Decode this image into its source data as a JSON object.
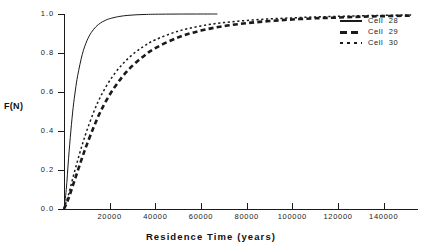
{
  "chart_data": {
    "type": "line",
    "title": "",
    "xlabel": "Residence Time  (years)",
    "ylabel": "F(N)",
    "xlim": [
      0,
      155000
    ],
    "ylim": [
      0.0,
      1.0
    ],
    "grid": false,
    "legend_position": "top-right",
    "xticks": [
      20000,
      40000,
      60000,
      80000,
      100000,
      120000,
      140000
    ],
    "xtick_labels": [
      "20000",
      "40000",
      "60000",
      "80000",
      "100000",
      "120000",
      "140000"
    ],
    "yticks": [
      0.0,
      0.2,
      0.4,
      0.6,
      0.8,
      1.0
    ],
    "ytick_labels": [
      "0.0",
      "0.2",
      "0.4",
      "0.6",
      "0.8",
      "1.0"
    ],
    "series": [
      {
        "name": "Cell  28",
        "style": "solid",
        "x": [
          0,
          1000,
          2000,
          3000,
          4000,
          5000,
          6000,
          8000,
          10000,
          12000,
          14000,
          16000,
          18000,
          20000,
          24000,
          28000,
          32000,
          36000,
          40000,
          46000,
          52000,
          58000,
          64000,
          67000
        ],
        "y": [
          0.0,
          0.1,
          0.26,
          0.4,
          0.52,
          0.61,
          0.685,
          0.793,
          0.862,
          0.906,
          0.935,
          0.954,
          0.967,
          0.976,
          0.987,
          0.993,
          0.9962,
          0.9978,
          0.9988,
          0.9995,
          0.9998,
          0.9999,
          1.0,
          1.0
        ]
      },
      {
        "name": "Cell  29",
        "style": "dashed-thick",
        "x": [
          0,
          2000,
          4000,
          6000,
          8000,
          10000,
          13000,
          16000,
          20000,
          25000,
          30000,
          35000,
          40000,
          50000,
          60000,
          70000,
          80000,
          90000,
          100000,
          110000,
          120000,
          130000,
          140000,
          152000
        ],
        "y": [
          0.0,
          0.055,
          0.125,
          0.195,
          0.265,
          0.33,
          0.42,
          0.5,
          0.586,
          0.67,
          0.735,
          0.785,
          0.825,
          0.88,
          0.915,
          0.938,
          0.953,
          0.964,
          0.972,
          0.978,
          0.982,
          0.986,
          0.989,
          0.992
        ]
      },
      {
        "name": "Cell  30",
        "style": "dotted-thin",
        "x": [
          0,
          2000,
          4000,
          6000,
          8000,
          10000,
          13000,
          16000,
          20000,
          25000,
          30000,
          35000,
          40000,
          50000,
          60000,
          70000,
          80000,
          90000,
          100000,
          110000,
          120000,
          130000,
          140000,
          152000
        ],
        "y": [
          0.0,
          0.075,
          0.165,
          0.25,
          0.33,
          0.402,
          0.497,
          0.576,
          0.658,
          0.735,
          0.792,
          0.835,
          0.868,
          0.912,
          0.939,
          0.956,
          0.967,
          0.975,
          0.98,
          0.985,
          0.988,
          0.991,
          0.993,
          0.995
        ]
      }
    ]
  },
  "legend": {
    "entries": [
      {
        "label": "Cell  28"
      },
      {
        "label": "Cell  29"
      },
      {
        "label": "Cell  30"
      }
    ]
  },
  "axes": {
    "y_title": "F(N)",
    "x_title": "Residence Time  (years)"
  }
}
